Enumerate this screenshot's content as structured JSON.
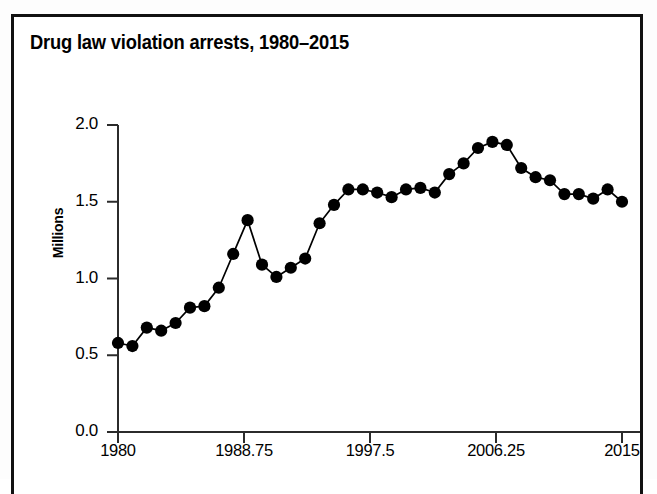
{
  "figure": {
    "title": "Drug law violation arrests, 1980–2015",
    "border_color": "#111111",
    "background": "#ffffff"
  },
  "chart_data": {
    "type": "line",
    "title": "Drug law violation arrests, 1980–2015",
    "xlabel": "",
    "ylabel": "Millions",
    "xlim": [
      1980,
      2015
    ],
    "ylim": [
      0.0,
      2.0
    ],
    "grid": false,
    "legend": null,
    "marker": "filled-circle",
    "marker_color": "#000000",
    "line_color": "#000000",
    "x_tick_labels": [
      "1980",
      "1988.75",
      "1997.5",
      "2006.25",
      "2015"
    ],
    "x_ticks": [
      1980,
      1988.75,
      1997.5,
      2006.25,
      2015
    ],
    "y_tick_labels": [
      "0.0",
      "0.5",
      "1.0",
      "1.5",
      "2.0"
    ],
    "y_ticks": [
      0.0,
      0.5,
      1.0,
      1.5,
      2.0
    ],
    "x": [
      1980,
      1981,
      1982,
      1983,
      1984,
      1985,
      1986,
      1987,
      1988,
      1989,
      1990,
      1991,
      1992,
      1993,
      1994,
      1995,
      1996,
      1997,
      1998,
      1999,
      2000,
      2001,
      2002,
      2003,
      2004,
      2005,
      2006,
      2007,
      2008,
      2009,
      2010,
      2011,
      2012,
      2013,
      2014,
      2015
    ],
    "values": [
      0.58,
      0.56,
      0.68,
      0.66,
      0.71,
      0.81,
      0.82,
      0.94,
      1.16,
      1.38,
      1.09,
      1.01,
      1.07,
      1.13,
      1.36,
      1.48,
      1.58,
      1.58,
      1.56,
      1.53,
      1.58,
      1.59,
      1.56,
      1.68,
      1.75,
      1.85,
      1.89,
      1.87,
      1.72,
      1.66,
      1.64,
      1.55,
      1.55,
      1.52,
      1.58,
      1.5
    ]
  }
}
